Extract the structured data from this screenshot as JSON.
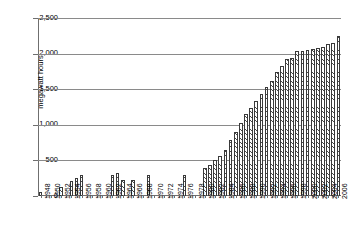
{
  "chart_data": {
    "type": "bar",
    "title": "",
    "subtitle": "",
    "xlabel": "",
    "ylabel": "megawatt hours",
    "ylim": [
      0,
      2500
    ],
    "ytick_values": [
      0,
      500,
      1000,
      1500,
      2000,
      2500
    ],
    "ytick_labels": [
      "0",
      "500",
      "1,000",
      "1,500",
      "2,000",
      "2,500"
    ],
    "grid": true,
    "grid_axis": "y",
    "legend": "none",
    "xlim_labels": [
      "1948",
      "2006"
    ],
    "xtick_labels": [
      "1948",
      "1950",
      "1952",
      "1954",
      "1956",
      "1958",
      "1960",
      "1962",
      "1964",
      "1966",
      "1968",
      "1970",
      "1972",
      "1974",
      "1976",
      "1978",
      "1980",
      "1982",
      "1984",
      "1986",
      "1988",
      "1990",
      "1992",
      "1994",
      "1996",
      "1998",
      "2000",
      "2002",
      "2004",
      "2006"
    ],
    "categories": [
      "1948",
      "1949",
      "1950",
      "1951",
      "1952",
      "1953",
      "1954",
      "1955",
      "1956",
      "1957",
      "1958",
      "1959",
      "1960",
      "1961",
      "1962",
      "1963",
      "1964",
      "1965",
      "1966",
      "1967",
      "1968",
      "1969",
      "1970",
      "1971",
      "1972",
      "1973",
      "1974",
      "1975",
      "1976",
      "1977",
      "1978",
      "1979",
      "1980",
      "1981",
      "1982",
      "1983",
      "1984",
      "1985",
      "1986",
      "1987",
      "1988",
      "1989",
      "1990",
      "1991",
      "1992",
      "1993",
      "1994",
      "1995",
      "1996",
      "1997",
      "1998",
      "1999",
      "2000",
      "2001",
      "2002",
      "2003",
      "2004",
      "2005",
      "2006"
    ],
    "values": [
      60,
      0,
      0,
      0,
      130,
      0,
      210,
      260,
      300,
      0,
      0,
      0,
      0,
      0,
      300,
      320,
      230,
      0,
      220,
      0,
      0,
      300,
      0,
      0,
      0,
      0,
      0,
      0,
      300,
      0,
      0,
      0,
      400,
      430,
      500,
      560,
      640,
      780,
      900,
      1030,
      1150,
      1240,
      1330,
      1430,
      1530,
      1620,
      1740,
      1830,
      1930,
      1940,
      2030,
      2040,
      2050,
      2060,
      2080,
      2090,
      2130,
      2150,
      2250
    ],
    "colors": {
      "bar_edge": "#3a3a3a",
      "bar_hatch": "#4a4a4a",
      "bar_fill": "#ffffff",
      "gridline": "#8a8a8a",
      "axis": "#6f6f6f",
      "background": "#ffffff",
      "text": "#000000"
    }
  }
}
